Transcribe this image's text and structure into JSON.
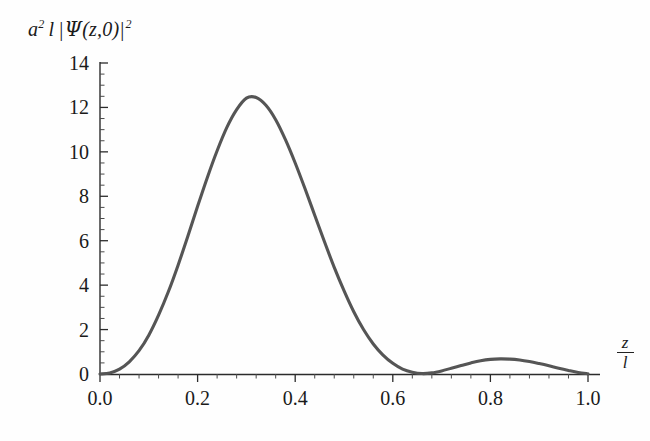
{
  "figure": {
    "background_color": "#fefefe",
    "curve_color": "#555555",
    "axis_color": "#2b2b2b"
  },
  "ylabel": {
    "a": "a",
    "a_exp": "2",
    "l": "l",
    "bar_open": "|",
    "psi": "Ψ",
    "arg": "(z,0)",
    "bar_close": "|",
    "sq_exp": "2",
    "plain": "a2 l |Ψ(z,0)|2"
  },
  "xlabel": {
    "numerator": "z",
    "denominator": "l"
  },
  "axes": {
    "y_ticks": [
      "0",
      "2",
      "4",
      "6",
      "8",
      "10",
      "12",
      "14"
    ],
    "x_ticks": [
      "0.0",
      "0.2",
      "0.4",
      "0.6",
      "0.8",
      "1.0"
    ]
  },
  "chart_data": {
    "type": "line",
    "title": "",
    "xlabel": "z/l",
    "ylabel": "a² l |Ψ(z,0)|²",
    "xlim": [
      0.0,
      1.0
    ],
    "ylim": [
      0,
      14
    ],
    "xticks": [
      0.0,
      0.2,
      0.4,
      0.6,
      0.8,
      1.0
    ],
    "yticks": [
      0,
      2,
      4,
      6,
      8,
      10,
      12,
      14
    ],
    "xtick_labels": [
      "0.0",
      "0.2",
      "0.4",
      "0.6",
      "0.8",
      "1.0"
    ],
    "ytick_labels": [
      "0",
      "2",
      "4",
      "6",
      "8",
      "10",
      "12",
      "14"
    ],
    "x_minor_step": 0.04,
    "y_minor_step": 0.5,
    "grid": false,
    "legend": null,
    "annotations": [],
    "series": [
      {
        "name": "a² l |Ψ(z,0)|²",
        "color": "#555555",
        "linewidth": 3.1,
        "x": [
          0.0,
          0.02,
          0.04,
          0.06,
          0.08,
          0.1,
          0.12,
          0.14,
          0.16,
          0.18,
          0.2,
          0.22,
          0.24,
          0.26,
          0.28,
          0.3,
          0.32,
          0.34,
          0.36,
          0.38,
          0.4,
          0.42,
          0.44,
          0.46,
          0.48,
          0.5,
          0.52,
          0.54,
          0.56,
          0.58,
          0.6,
          0.62,
          0.64,
          0.66,
          0.68,
          0.7,
          0.72,
          0.74,
          0.76,
          0.78,
          0.8,
          0.82,
          0.84,
          0.86,
          0.88,
          0.9,
          0.92,
          0.94,
          0.96,
          0.98,
          1.0
        ],
        "y": [
          0.0,
          0.05,
          0.22,
          0.55,
          1.05,
          1.75,
          2.65,
          3.7,
          4.9,
          6.2,
          7.55,
          8.85,
          10.05,
          11.1,
          11.9,
          12.42,
          12.45,
          12.1,
          11.45,
          10.55,
          9.5,
          8.35,
          7.15,
          5.95,
          4.8,
          3.75,
          2.8,
          2.0,
          1.35,
          0.85,
          0.48,
          0.22,
          0.08,
          0.02,
          0.05,
          0.14,
          0.26,
          0.38,
          0.5,
          0.6,
          0.66,
          0.68,
          0.67,
          0.63,
          0.56,
          0.47,
          0.37,
          0.26,
          0.16,
          0.07,
          0.01
        ]
      }
    ],
    "features": {
      "primary_peak": {
        "x": 0.31,
        "y": 12.45
      },
      "minimum": {
        "x": 0.66,
        "y": 0.02
      },
      "secondary_peak": {
        "x": 0.82,
        "y": 0.68
      },
      "start": {
        "x": 0.0,
        "y": 0.0
      },
      "end": {
        "x": 1.0,
        "y": 0.0
      }
    }
  }
}
